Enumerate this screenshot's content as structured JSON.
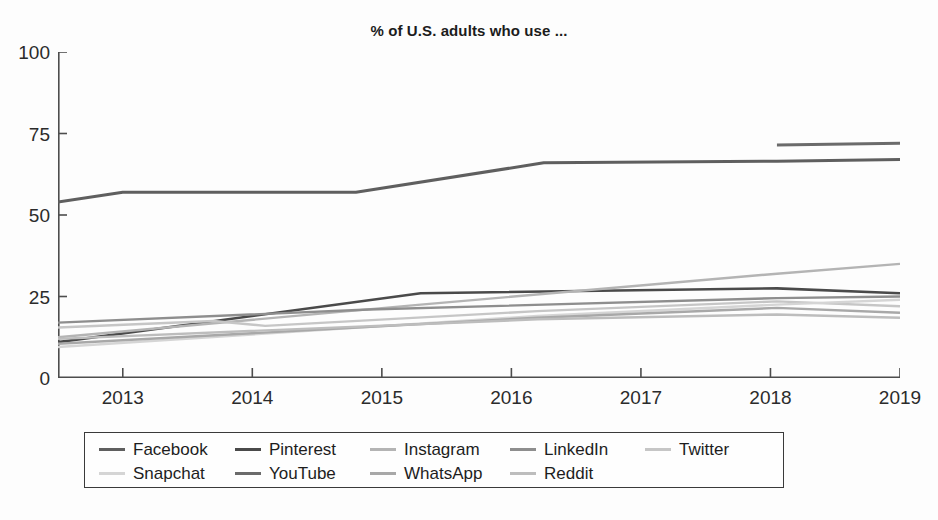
{
  "chart_data": {
    "type": "line",
    "title": "% of U.S. adults who use ...",
    "xlabel": "",
    "ylabel": "",
    "xlim": [
      2012.5,
      2019.0
    ],
    "ylim": [
      0,
      100
    ],
    "yticks": [
      0,
      25,
      50,
      75,
      100
    ],
    "xticks": [
      2013,
      2014,
      2015,
      2016,
      2017,
      2018,
      2019
    ],
    "ytick_labels": [
      "0",
      "25",
      "50",
      "75",
      "100"
    ],
    "xtick_labels": [
      "2013",
      "2014",
      "2015",
      "2016",
      "2017",
      "2018",
      "2019"
    ],
    "grid": false,
    "legend_position": "below-center",
    "series": [
      {
        "name": "Facebook",
        "color": "#5f5f5f",
        "width": 3.0,
        "x": [
          2012.5,
          2013.0,
          2014.8,
          2016.25,
          2018.05,
          2019.0
        ],
        "values": [
          54,
          57,
          57,
          66,
          66.5,
          67
        ]
      },
      {
        "name": "Pinterest",
        "color": "#4a4a4a",
        "width": 2.6,
        "x": [
          2012.5,
          2015.3,
          2018.05,
          2019.0
        ],
        "values": [
          11,
          26,
          27.5,
          26
        ]
      },
      {
        "name": "Instagram",
        "color": "#b4b4b4",
        "width": 2.4,
        "x": [
          2012.5,
          2015.3,
          2018.05,
          2019.0
        ],
        "values": [
          12.5,
          22.5,
          32,
          35
        ]
      },
      {
        "name": "LinkedIn",
        "color": "#8e8e8e",
        "width": 2.4,
        "x": [
          2012.5,
          2014.9,
          2018.05,
          2019.0
        ],
        "values": [
          17,
          21,
          24.5,
          25
        ]
      },
      {
        "name": "Twitter",
        "color": "#c6c6c6",
        "width": 2.4,
        "x": [
          2012.5,
          2013.7,
          2014.1,
          2016.2,
          2018.05,
          2019.0
        ],
        "values": [
          15.5,
          17.5,
          16,
          20.5,
          23.5,
          22
        ]
      },
      {
        "name": "Snapchat",
        "color": "#d5d5d5",
        "width": 2.4,
        "x": [
          2012.5,
          2016.2,
          2018.05,
          2019.0
        ],
        "values": [
          9.5,
          19,
          22.5,
          24
        ]
      },
      {
        "name": "YouTube",
        "color": "#6b6b6b",
        "width": 3.0,
        "x": [
          2018.05,
          2019.0
        ],
        "values": [
          71.5,
          72
        ]
      },
      {
        "name": "WhatsApp",
        "color": "#a8a8a8",
        "width": 2.4,
        "x": [
          2012.5,
          2016.2,
          2018.05,
          2019.0
        ],
        "values": [
          10.5,
          18.5,
          21.5,
          20
        ]
      },
      {
        "name": "Reddit",
        "color": "#bdbdbd",
        "width": 2.4,
        "x": [
          2012.5,
          2016.2,
          2018.05,
          2019.0
        ],
        "values": [
          12,
          18,
          19.5,
          18.5
        ]
      }
    ]
  },
  "legend": {
    "rows": [
      [
        {
          "label": "Facebook",
          "color": "#5f5f5f"
        },
        {
          "label": "Pinterest",
          "color": "#4a4a4a"
        },
        {
          "label": "Instagram",
          "color": "#b4b4b4"
        },
        {
          "label": "LinkedIn",
          "color": "#8e8e8e"
        },
        {
          "label": "Twitter",
          "color": "#c6c6c6"
        }
      ],
      [
        {
          "label": "Snapchat",
          "color": "#d5d5d5"
        },
        {
          "label": "YouTube",
          "color": "#6b6b6b"
        },
        {
          "label": "WhatsApp",
          "color": "#a8a8a8"
        },
        {
          "label": "Reddit",
          "color": "#bdbdbd"
        },
        {
          "label": "",
          "color": "transparent"
        }
      ]
    ]
  },
  "footer": {
    "text": ""
  }
}
